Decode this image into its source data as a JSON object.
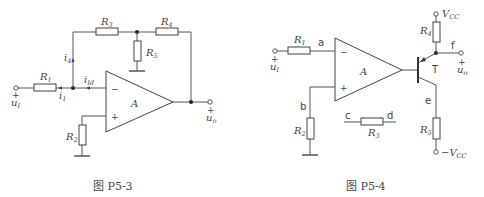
{
  "figures": [
    {
      "caption": "图 P5-3",
      "components": [
        "R1",
        "R2",
        "R3",
        "R4",
        "R5",
        "A"
      ],
      "labels": {
        "R1": "R",
        "R1_sub": "1",
        "R2": "R",
        "R2_sub": "2",
        "R3": "R",
        "R3_sub": "3",
        "R4": "R",
        "R4_sub": "4",
        "R5": "R",
        "R5_sub": "5",
        "amp": "A",
        "minus": "−",
        "plus": "+",
        "ui": "u",
        "ui_sub": "I",
        "ui_plus": "+",
        "uo": "u",
        "uo_sub": "o",
        "uo_plus": "+",
        "i1": "i",
        "i1_sub": "1",
        "i4": "i",
        "i4_sub": "4",
        "iid": "i",
        "iid_sub": "Id"
      }
    },
    {
      "caption": "图 P5-4",
      "components": [
        "R1",
        "R2",
        "R3",
        "R4",
        "R5",
        "A",
        "T"
      ],
      "labels": {
        "R1": "R",
        "R1_sub": "1",
        "R2": "R",
        "R2_sub": "2",
        "R3": "R",
        "R3_sub": "3",
        "R4": "R",
        "R4_sub": "4",
        "R5": "R",
        "R5_sub": "5",
        "amp": "A",
        "minus": "−",
        "plus": "+",
        "ui": "u",
        "ui_sub": "I",
        "ui_plus": "+",
        "uo": "u",
        "uo_sub": "o",
        "uo_plus": "+",
        "T": "T",
        "vcc": "V",
        "vcc_sub": "CC",
        "neg_vcc": "−V",
        "neg_vcc_sub": "CC",
        "a": "a",
        "b": "b",
        "c": "c",
        "d": "d",
        "e": "e",
        "f": "f"
      }
    }
  ]
}
